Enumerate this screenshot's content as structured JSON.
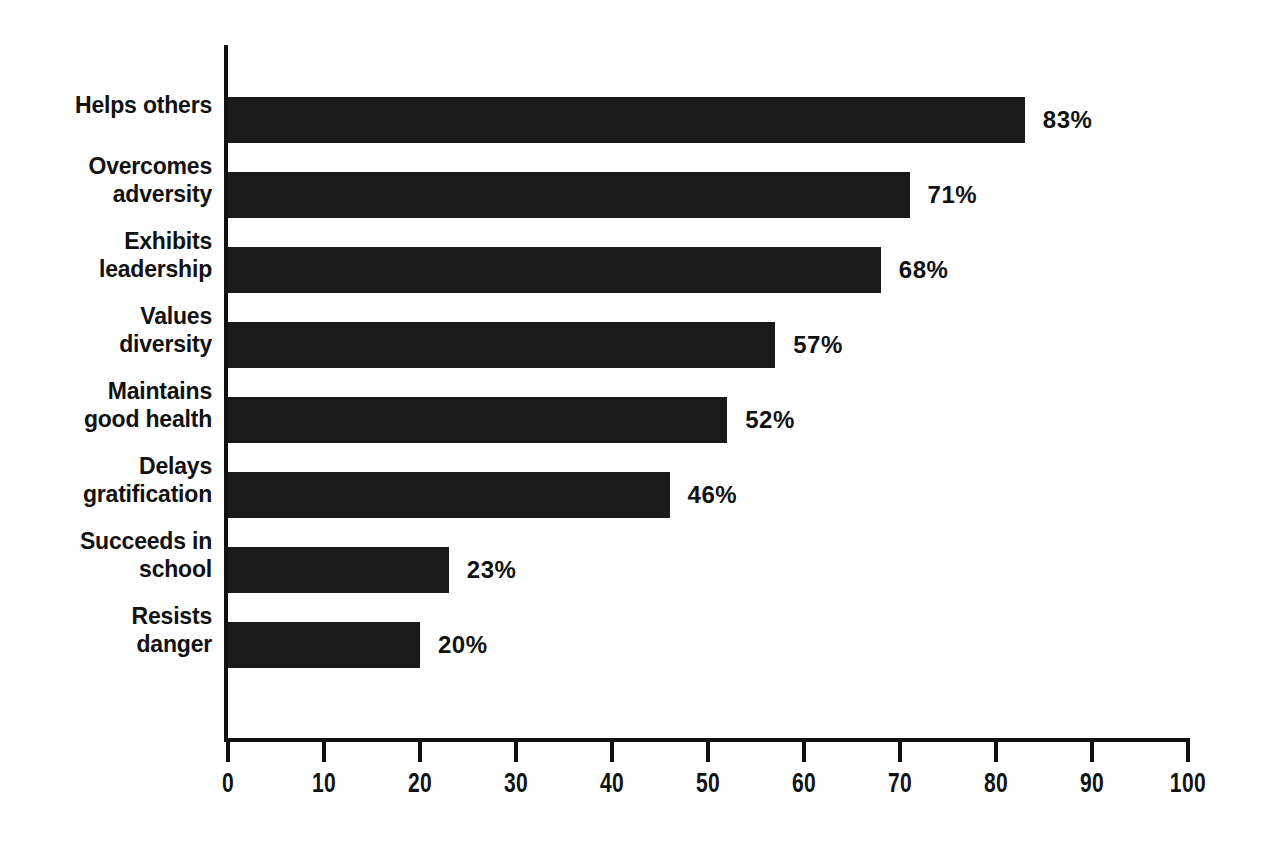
{
  "chart_data": {
    "type": "bar",
    "orientation": "horizontal",
    "title": "",
    "subtitle": "",
    "xlabel": "",
    "ylabel": "",
    "xlim": [
      0,
      100
    ],
    "xticks": [
      "0",
      "10",
      "20",
      "30",
      "40",
      "50",
      "60",
      "70",
      "80",
      "90",
      "100"
    ],
    "xtick_values": [
      0,
      10,
      20,
      30,
      40,
      50,
      60,
      70,
      80,
      90,
      100
    ],
    "grid": false,
    "legend": false,
    "value_suffix": "%",
    "bar_color": "#1a1a1a",
    "axis_color": "#111111",
    "background": "#ffffff",
    "categories": [
      "Helps others",
      "Overcomes adversity",
      "Exhibits leadership",
      "Values diversity",
      "Maintains good health",
      "Delays gratification",
      "Succeeds in school",
      "Resists danger"
    ],
    "values": [
      83,
      71,
      68,
      57,
      52,
      46,
      23,
      20
    ],
    "value_labels": [
      "83%",
      "71%",
      "68%",
      "57%",
      "52%",
      "46%",
      "23%",
      "20%"
    ],
    "bars": [
      {
        "category_line1": "Helps others",
        "category_line2": "",
        "value": 83,
        "value_label": "83%"
      },
      {
        "category_line1": "Overcomes",
        "category_line2": "adversity",
        "value": 71,
        "value_label": "71%"
      },
      {
        "category_line1": "Exhibits",
        "category_line2": "leadership",
        "value": 68,
        "value_label": "68%"
      },
      {
        "category_line1": "Values",
        "category_line2": "diversity",
        "value": 57,
        "value_label": "57%"
      },
      {
        "category_line1": "Maintains",
        "category_line2": "good health",
        "value": 52,
        "value_label": "52%"
      },
      {
        "category_line1": "Delays",
        "category_line2": "gratification",
        "value": 46,
        "value_label": "46%"
      },
      {
        "category_line1": "Succeeds in",
        "category_line2": "school",
        "value": 23,
        "value_label": "23%"
      },
      {
        "category_line1": "Resists",
        "category_line2": "danger",
        "value": 20,
        "value_label": "20%"
      }
    ]
  }
}
